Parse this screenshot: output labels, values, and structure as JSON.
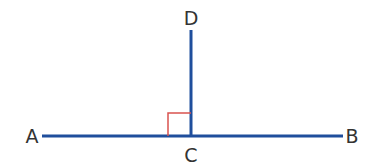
{
  "diagram": {
    "colors": {
      "line": "#1f4e9c",
      "right_angle_marker": "#d9534f",
      "label": "#333333",
      "background": "#ffffff"
    },
    "points": [
      {
        "id": "A",
        "label": "A",
        "x": 32,
        "y": 143
      },
      {
        "id": "B",
        "label": "B",
        "x": 352,
        "y": 143
      },
      {
        "id": "C",
        "label": "C",
        "x": 191,
        "y": 162
      },
      {
        "id": "D",
        "label": "D",
        "x": 191,
        "y": 25
      }
    ],
    "segments": [
      {
        "name": "AB",
        "x1": 42,
        "y1": 136,
        "x2": 343,
        "y2": 136
      },
      {
        "name": "CD",
        "x1": 191,
        "y1": 30,
        "x2": 191,
        "y2": 136
      }
    ],
    "right_angle": {
      "at": "C",
      "x": 168,
      "y": 113,
      "size": 23
    }
  }
}
